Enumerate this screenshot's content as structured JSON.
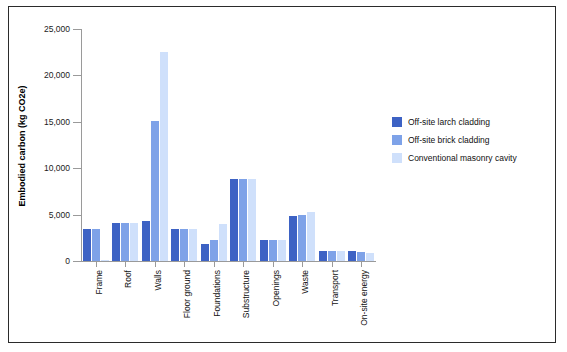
{
  "chart_data": {
    "type": "bar",
    "title": "",
    "xlabel": "",
    "ylabel": "Embodied carbon (kg CO2e)",
    "ylim": [
      0,
      25000
    ],
    "yticks": [
      0,
      5000,
      10000,
      15000,
      20000,
      25000
    ],
    "ytick_labels": [
      "0",
      "5,000",
      "10,000",
      "15,000",
      "20,000",
      "25,000"
    ],
    "grid": false,
    "legend_position": "right",
    "categories": [
      "Frame",
      "Roof",
      "Walls",
      "Floor ground",
      "Foundations",
      "Substructure",
      "Openings",
      "Waste",
      "Transport",
      "On-site energy"
    ],
    "series": [
      {
        "name": "Off-site larch cladding",
        "color": "#3d62c4",
        "values": [
          3500,
          4050,
          4350,
          3450,
          1800,
          8800,
          2300,
          4850,
          1050,
          1050
        ]
      },
      {
        "name": "Off-site brick cladding",
        "color": "#7ea2e8",
        "values": [
          3500,
          4050,
          15100,
          3450,
          2300,
          8800,
          2300,
          4950,
          1050,
          950
        ]
      },
      {
        "name": "Conventional masonry cavity",
        "color": "#cfe0fb",
        "values": [
          100,
          4050,
          22500,
          3450,
          3950,
          8800,
          2300,
          5300,
          1050,
          850
        ]
      }
    ]
  },
  "legend": {
    "items": [
      "Off-site larch cladding",
      "Off-site brick cladding",
      "Conventional masonry cavity"
    ]
  }
}
